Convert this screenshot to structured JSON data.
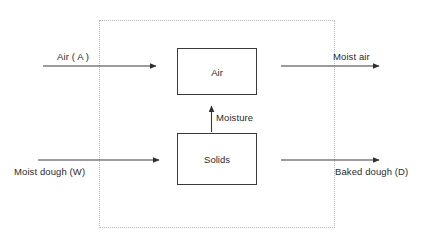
{
  "diagram": {
    "type": "block-flow-diagram",
    "boundary": {
      "name": "system-boundary",
      "style": "dotted",
      "color": "#b9b9b9"
    },
    "blocks": [
      {
        "id": "air",
        "label": "Air"
      },
      {
        "id": "solids",
        "label": "Solids"
      }
    ],
    "streams": [
      {
        "id": "air-in",
        "label": "Air ( A )",
        "direction": "right",
        "position": "inlet-top",
        "label_side": "above"
      },
      {
        "id": "moist-air-out",
        "label": "Moist air",
        "direction": "right",
        "position": "outlet-top",
        "label_side": "above"
      },
      {
        "id": "moisture-transfer",
        "label": "Moisture",
        "direction": "up",
        "position": "internal",
        "label_side": "right"
      },
      {
        "id": "moist-dough-in",
        "label": "Moist dough (W)",
        "direction": "right",
        "position": "inlet-bottom",
        "label_side": "below"
      },
      {
        "id": "baked-dough-out",
        "label": "Baked dough (D)",
        "direction": "right",
        "position": "outlet-bottom",
        "label_side": "below"
      }
    ],
    "colors": {
      "line": "#3a3a3a",
      "text": "#2b2b2b",
      "boundary": "#b9b9b9",
      "background": "#ffffff"
    }
  }
}
